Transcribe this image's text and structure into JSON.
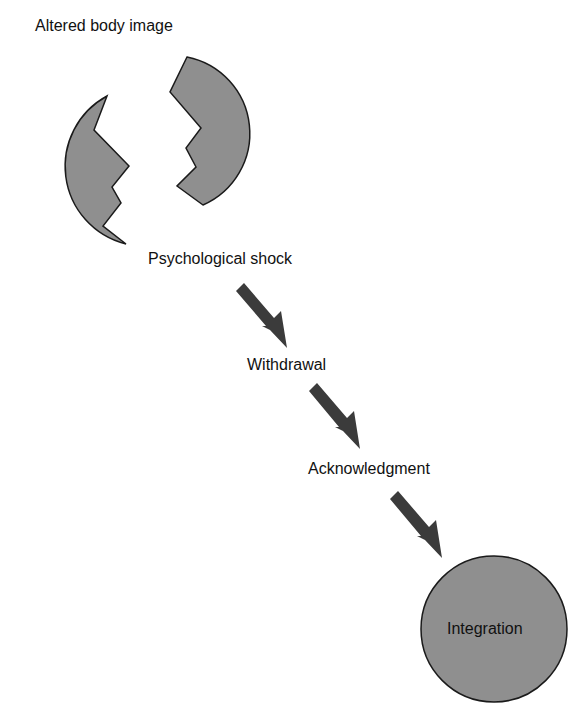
{
  "diagram": {
    "title": "Altered body image",
    "stages": [
      {
        "label": "Psychological shock"
      },
      {
        "label": "Withdrawal"
      },
      {
        "label": "Acknowledgment"
      },
      {
        "label": "Integration"
      }
    ],
    "colors": {
      "shape_fill": "#8f8f8f",
      "shape_stroke": "#1a1a1a",
      "arrow": "#3b3b3b",
      "text": "#111111",
      "background": "#ffffff"
    }
  }
}
